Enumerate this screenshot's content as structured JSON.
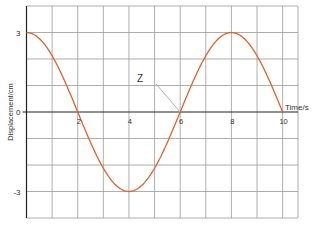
{
  "chart_data": {
    "type": "line",
    "title": "",
    "xlabel": "Time/s",
    "ylabel": "Displacement/cm",
    "xlim": [
      0,
      10.6
    ],
    "ylim": [
      -4,
      4
    ],
    "grid": true,
    "legend": null,
    "x_ticks": [
      2,
      4,
      6,
      8,
      10
    ],
    "x_tick_labels": [
      "2",
      "4",
      "6",
      "8",
      "10"
    ],
    "y_ticks": [
      3,
      0,
      -3
    ],
    "y_tick_labels": [
      "3",
      "0",
      "-3"
    ],
    "series": [
      {
        "name": "displacement",
        "color": "#e0622d",
        "function": "3*cos(pi*t/4)",
        "x": [
          0,
          1,
          2,
          3,
          4,
          5,
          6,
          7,
          8,
          9,
          10
        ],
        "y": [
          3,
          2.12,
          0,
          -2.12,
          -3,
          -2.12,
          0,
          2.12,
          3,
          2.12,
          0
        ]
      }
    ],
    "annotations": [
      {
        "text": "Z",
        "points_to": [
          6,
          0
        ]
      }
    ]
  },
  "colors": {
    "grid": "#9a9a9a",
    "axis": "#222222",
    "curve": "#e0622d",
    "leader": "#aaaaaa"
  }
}
